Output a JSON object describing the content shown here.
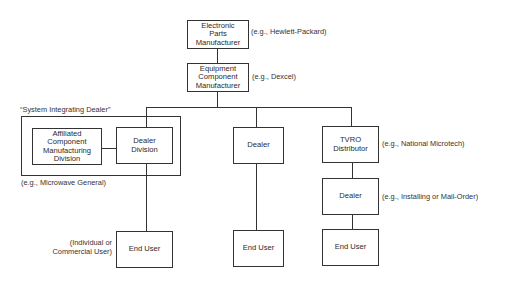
{
  "diagram": {
    "type": "organization-flow",
    "nodes": {
      "electronic_parts": {
        "label": "Electronic\nParts\nManufacturer",
        "example": "(e.g., Hewlett-Packard)"
      },
      "equipment_component": {
        "label": "Equipment\nComponent\nManufacturer",
        "example": "(e.g., Dexcel)"
      },
      "system_integrating_dealer": {
        "title": "“System Integrating Dealer”",
        "example": "(e.g., Microwave General)"
      },
      "affiliated_division": {
        "label": "Affiliated\nComponent\nManufacturing\nDivision"
      },
      "dealer_division": {
        "label": "Dealer\nDivision"
      },
      "dealer_middle": {
        "label": "Dealer"
      },
      "tvro_distributor": {
        "label": "TVRO\nDistributor",
        "example": "(e.g., National Microtech)"
      },
      "dealer_right": {
        "label": "Dealer",
        "example": "(e.g., Installing or Mail-Order)"
      },
      "end_user_left": {
        "label": "End User",
        "note": "(Individual or\nCommercial User)"
      },
      "end_user_middle": {
        "label": "End User"
      },
      "end_user_right": {
        "label": "End User"
      }
    },
    "edges": [
      [
        "electronic_parts",
        "equipment_component"
      ],
      [
        "equipment_component",
        "dealer_division"
      ],
      [
        "equipment_component",
        "dealer_middle"
      ],
      [
        "equipment_component",
        "tvro_distributor"
      ],
      [
        "affiliated_division",
        "dealer_division"
      ],
      [
        "dealer_division",
        "end_user_left"
      ],
      [
        "dealer_middle",
        "end_user_middle"
      ],
      [
        "tvro_distributor",
        "dealer_right"
      ],
      [
        "dealer_right",
        "end_user_right"
      ]
    ]
  }
}
